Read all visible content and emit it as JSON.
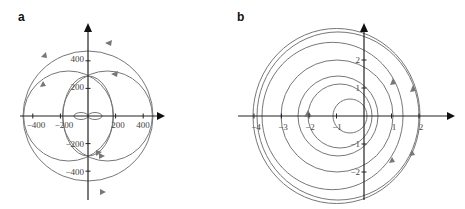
{
  "panels": [
    {
      "label": "a",
      "x_ticks": [
        "−400",
        "−200",
        "200",
        "400"
      ],
      "x_tick_values": [
        -400,
        -200,
        200,
        400
      ],
      "y_ticks": [
        "400",
        "200",
        "−200",
        "−400"
      ],
      "y_tick_values": [
        400,
        200,
        -200,
        -400
      ]
    },
    {
      "label": "b",
      "x_ticks": [
        "−4",
        "−3",
        "−2",
        "−1",
        "1",
        "2"
      ],
      "x_tick_values": [
        -4,
        -3,
        -2,
        -1,
        1,
        2
      ],
      "y_ticks": [
        "2",
        "1",
        "−1",
        "−2"
      ],
      "y_tick_values": [
        2,
        1,
        -1,
        -2
      ]
    }
  ],
  "colors": {
    "curve": "#777777",
    "axis": "#222222"
  }
}
